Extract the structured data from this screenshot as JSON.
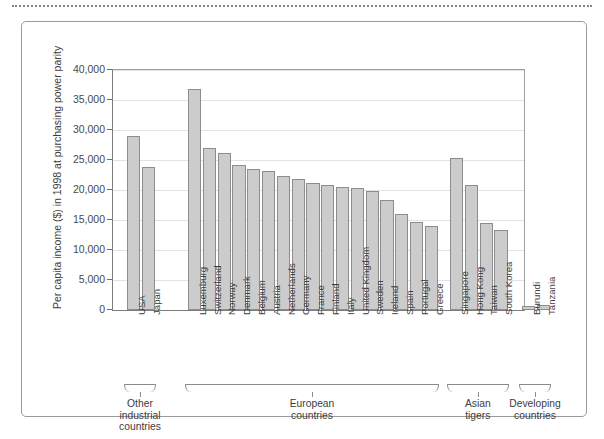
{
  "figure": {
    "top_rule": "dotted-separator"
  },
  "chart_data": {
    "type": "bar",
    "title": "",
    "xlabel": "",
    "ylabel": "Per capita income ($) in 1998 at purchasing power parity",
    "ylim": [
      0,
      40000
    ],
    "ytick_values": [
      0,
      5000,
      10000,
      15000,
      20000,
      25000,
      30000,
      35000,
      40000
    ],
    "ytick_labels": [
      "0",
      "5,000",
      "10,000",
      "15,000",
      "20,000",
      "25,000",
      "30,000",
      "35,000",
      "40,000"
    ],
    "grid": true,
    "legend": "none",
    "bar_fill_color": "#cccccc",
    "bar_edge_color": "#8d8d8d",
    "categories": [
      "USA",
      "Japan",
      "Luxemburg",
      "Switzerland",
      "Norway",
      "Denmark",
      "Belgium",
      "Austria",
      "Netherlands",
      "Germany",
      "France",
      "Finland",
      "Italy",
      "United Kingdom",
      "Sweden",
      "Ireland",
      "Spain",
      "Portugal",
      "Greece",
      "Singapore",
      "Hong Kong",
      "Taiwan",
      "South Korea",
      "Burundi",
      "Tanzania"
    ],
    "values": [
      29000,
      23800,
      36800,
      27000,
      26200,
      24200,
      23500,
      23200,
      22300,
      21800,
      21200,
      20800,
      20500,
      20400,
      19800,
      18300,
      16000,
      14600,
      14000,
      25300,
      20900,
      14500,
      13400,
      700,
      800
    ],
    "groups": [
      {
        "label": "Other\nindustrial\ncountries",
        "label_lines": [
          "Other",
          "industrial",
          "countries"
        ],
        "start": 0,
        "end": 1
      },
      {
        "label": "European\ncountries",
        "label_lines": [
          "European",
          "countries"
        ],
        "start": 2,
        "end": 18
      },
      {
        "label": "Asian\ntigers",
        "label_lines": [
          "Asian",
          "tigers"
        ],
        "start": 19,
        "end": 22
      },
      {
        "label": "Developing\ncountries",
        "label_lines": [
          "Developing",
          "countries"
        ],
        "start": 23,
        "end": 24
      }
    ]
  }
}
